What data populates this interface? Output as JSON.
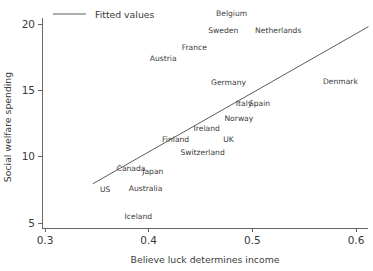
{
  "chart_data": {
    "type": "scatter",
    "title": "",
    "xlabel": "Believe luck determines income",
    "ylabel": "Social welfare spending",
    "xlim": [
      0.3,
      0.6
    ],
    "ylim": [
      5,
      20
    ],
    "xticks": [
      "0.3",
      "0.4",
      "0.5",
      "0.6"
    ],
    "xtick_values": [
      0.3,
      0.4,
      0.5,
      0.6
    ],
    "yticks": [
      "5",
      "10",
      "15",
      "20"
    ],
    "ytick_values": [
      5,
      10,
      15,
      20
    ],
    "grid": false,
    "legend_position": "top-left",
    "legend": [
      {
        "label": "Fitted values",
        "marker": "line",
        "color": "#4a4a4a"
      }
    ],
    "point_label_style": "text-only",
    "points": [
      {
        "label": "Belgium",
        "x": 0.48,
        "y": 20.8
      },
      {
        "label": "Sweden",
        "x": 0.472,
        "y": 19.5
      },
      {
        "label": "Netherlands",
        "x": 0.525,
        "y": 19.5
      },
      {
        "label": "France",
        "x": 0.444,
        "y": 18.2
      },
      {
        "label": "Austria",
        "x": 0.414,
        "y": 17.4
      },
      {
        "label": "Germany",
        "x": 0.477,
        "y": 15.6
      },
      {
        "label": "Denmark",
        "x": 0.585,
        "y": 15.7
      },
      {
        "label": "Italy",
        "x": 0.492,
        "y": 14.0
      },
      {
        "label": "Spain",
        "x": 0.507,
        "y": 14.0
      },
      {
        "label": "Norway",
        "x": 0.487,
        "y": 12.9
      },
      {
        "label": "Ireland",
        "x": 0.456,
        "y": 12.1
      },
      {
        "label": "UK",
        "x": 0.477,
        "y": 11.3
      },
      {
        "label": "Finland",
        "x": 0.426,
        "y": 11.3
      },
      {
        "label": "Switzerland",
        "x": 0.452,
        "y": 10.3
      },
      {
        "label": "Canada",
        "x": 0.383,
        "y": 9.1
      },
      {
        "label": "Japan",
        "x": 0.404,
        "y": 8.9
      },
      {
        "label": "US",
        "x": 0.358,
        "y": 7.5
      },
      {
        "label": "Australia",
        "x": 0.397,
        "y": 7.6
      },
      {
        "label": "Iceland",
        "x": 0.39,
        "y": 5.5
      }
    ],
    "fitted_line": {
      "name": "Fitted values",
      "x_start": 0.346,
      "y_start": 7.95,
      "x_end": 0.612,
      "y_end": 19.8
    }
  }
}
